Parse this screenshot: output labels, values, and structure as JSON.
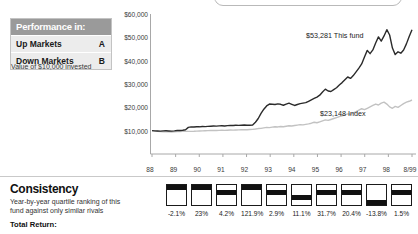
{
  "performance_box": {
    "header": "Performance in:",
    "rows": [
      {
        "label": "Up Markets",
        "grade": "A"
      },
      {
        "label": "Down Markets",
        "grade": "B"
      }
    ],
    "note": "Value of $10,000 invested"
  },
  "consistency": {
    "title": "Consistency",
    "subtitle": "Year-by-year quartile ranking of this fund against only similar rivals",
    "total_return_label": "Total Return:"
  },
  "chart_data": {
    "type": "line",
    "title": "",
    "xlabel": "",
    "ylabel": "",
    "ylim": [
      0,
      60000
    ],
    "ytick_labels": [
      "$60,000",
      "$50,000",
      "$40,000",
      "$30,000",
      "$20,000",
      "$10,000"
    ],
    "ytick_values": [
      60000,
      50000,
      40000,
      30000,
      20000,
      10000
    ],
    "xtick_labels": [
      "88",
      "89",
      "90",
      "91",
      "92",
      "93",
      "94",
      "95",
      "96",
      "97",
      "98",
      "8/99"
    ],
    "grid": false,
    "legend_position": "inline-right",
    "annotations": [
      {
        "text": "$53,281 This fund",
        "value": 53281,
        "series": "This fund"
      },
      {
        "text": "$23,148 Index",
        "value": 23148,
        "series": "Index"
      }
    ],
    "series": [
      {
        "name": "This fund",
        "color": "#2b2b2b",
        "final_value": 53281,
        "values": [
          10000,
          9900,
          9850,
          9800,
          9900,
          9950,
          9880,
          9820,
          9900,
          10050,
          10100,
          10200,
          10400,
          11400,
          11600,
          11550,
          11700,
          11650,
          11800,
          11750,
          11820,
          11900,
          12000,
          11950,
          12050,
          12100,
          12000,
          12150,
          12250,
          12200,
          12300,
          12280,
          12350,
          12400,
          12300,
          12350,
          12400,
          13600,
          15200,
          17400,
          19200,
          20600,
          21400,
          21300,
          21200,
          21500,
          21300,
          20900,
          21400,
          21800,
          21300,
          20800,
          21200,
          21600,
          21800,
          22000,
          22600,
          23200,
          23800,
          24400,
          25200,
          26600,
          27800,
          27000,
          26800,
          27600,
          28400,
          29600,
          30600,
          31800,
          33000,
          32400,
          33600,
          35200,
          36800,
          38600,
          41600,
          44400,
          43000,
          44600,
          47600,
          50200,
          48400,
          50600,
          53281,
          51000,
          45400,
          42600,
          43800,
          43200,
          44600,
          47200,
          50400,
          53281
        ]
      },
      {
        "name": "Index",
        "color": "#c2c2c2",
        "final_value": 23148,
        "values": [
          10000,
          9800,
          9700,
          9600,
          9550,
          9500,
          9480,
          9440,
          9500,
          9600,
          9650,
          9700,
          9750,
          9700,
          9680,
          9720,
          9800,
          9850,
          9900,
          9950,
          10000,
          10050,
          10100,
          10060,
          10120,
          10180,
          10140,
          10200,
          10260,
          10220,
          10280,
          10340,
          10400,
          10460,
          10420,
          10480,
          10540,
          10700,
          10900,
          11000,
          11200,
          11400,
          11300,
          11500,
          11700,
          11600,
          11800,
          11700,
          11900,
          12100,
          12000,
          12200,
          12400,
          12600,
          12500,
          12700,
          12900,
          13200,
          13600,
          13400,
          13800,
          14200,
          14600,
          14400,
          14800,
          15200,
          15600,
          16000,
          16400,
          16800,
          17200,
          17000,
          17600,
          18200,
          18800,
          19400,
          19000,
          19600,
          20200,
          20800,
          21400,
          21000,
          21800,
          22200,
          21400,
          20200,
          19600,
          20400,
          20000,
          20800,
          21600,
          22200,
          22600,
          23148
        ]
      }
    ],
    "quartile_rankings": [
      1,
      1,
      2,
      1,
      2,
      3,
      2,
      2,
      4,
      2
    ],
    "annual_returns": [
      "-2.1%",
      "23%",
      "4.2%",
      "121.9%",
      "2.9%",
      "11.1%",
      "31.7%",
      "20.4%",
      "-13.8%",
      "1.5%"
    ]
  }
}
